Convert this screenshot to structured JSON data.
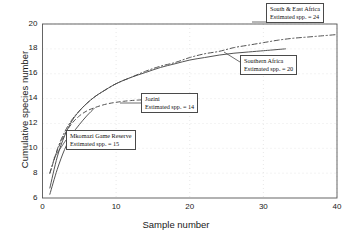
{
  "chart_data": {
    "type": "line",
    "title": "",
    "xlabel": "Sample number",
    "ylabel": "Cumulative species number",
    "xlim": [
      0,
      40
    ],
    "ylim": [
      6,
      20
    ],
    "xticks": [
      0,
      10,
      20,
      30,
      40
    ],
    "yticks": [
      6,
      8,
      10,
      12,
      14,
      16,
      18,
      20
    ],
    "grid": true,
    "legend_position": "annotations-inline",
    "series": [
      {
        "name": "South & East Africa",
        "estimated_spp": 24,
        "style": "dash-dot",
        "x": [
          1,
          2,
          3,
          4,
          5,
          6,
          7,
          8,
          10,
          12,
          14,
          16,
          18,
          20,
          22,
          24,
          26,
          28,
          30,
          32,
          34,
          36,
          38,
          40
        ],
        "y": [
          8.0,
          9.9,
          11.3,
          12.3,
          13.0,
          13.6,
          14.1,
          14.5,
          15.2,
          15.7,
          16.2,
          16.6,
          16.9,
          17.3,
          17.6,
          17.8,
          18.1,
          18.3,
          18.5,
          18.7,
          18.85,
          18.95,
          19.05,
          19.15
        ]
      },
      {
        "name": "Southern Africa",
        "estimated_spp": 20,
        "style": "solid",
        "x": [
          1,
          2,
          3,
          4,
          5,
          6,
          7,
          8,
          10,
          12,
          14,
          16,
          18,
          20,
          22,
          24,
          26,
          28,
          30,
          31,
          32,
          33
        ],
        "y": [
          6.8,
          9.3,
          11.0,
          12.2,
          13.0,
          13.6,
          14.1,
          14.5,
          15.2,
          15.7,
          16.1,
          16.5,
          16.8,
          17.1,
          17.3,
          17.5,
          17.65,
          17.75,
          17.85,
          17.9,
          17.95,
          18.0
        ]
      },
      {
        "name": "Jozini",
        "estimated_spp": 14,
        "style": "dashed",
        "x": [
          1,
          2,
          3,
          4,
          5,
          6,
          7,
          8,
          9,
          10,
          11,
          12,
          13,
          14,
          15,
          16,
          17,
          18
        ],
        "y": [
          8.0,
          9.8,
          11.1,
          12.0,
          12.6,
          13.0,
          13.25,
          13.45,
          13.6,
          13.7,
          13.78,
          13.84,
          13.88,
          13.91,
          13.93,
          13.95,
          13.96,
          13.97
        ]
      },
      {
        "name": "Mkomazi Game Reserve",
        "estimated_spp": 15,
        "style": "solid",
        "x": [
          1,
          2,
          3,
          4,
          5,
          6,
          7
        ],
        "y": [
          6.3,
          8.3,
          9.9,
          11.1,
          11.9,
          12.6,
          13.2
        ]
      }
    ]
  },
  "annotations": [
    {
      "id": "south-east-africa",
      "line1": "South & East Africa",
      "line2": "Estimated spp. = 24"
    },
    {
      "id": "southern-africa",
      "line1": "Southern Africa",
      "line2": "Estimated spp. = 20"
    },
    {
      "id": "jozini",
      "line1": "Jozini",
      "line2": "Estimated spp. = 14"
    },
    {
      "id": "mkomazi-game-reserve",
      "line1": "Mkomazi Game Reserve",
      "line2": "Estimated spp. = 15"
    }
  ],
  "axes": {
    "x_title": "Sample number",
    "y_title": "Cumulative species number",
    "x_tick_labels": [
      "0",
      "10",
      "20",
      "30",
      "40"
    ],
    "y_tick_labels": [
      "6",
      "8",
      "10",
      "12",
      "14",
      "16",
      "18",
      "20"
    ]
  },
  "colors": {
    "line": "#4a4a4a",
    "axis": "#555555",
    "grid": "#d9d9d9",
    "background": "#ffffff",
    "text": "#1a1a1a"
  }
}
